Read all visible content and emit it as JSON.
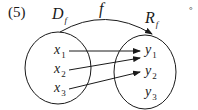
{
  "problem_number": "(5)",
  "domain_label": {
    "main": "D",
    "sub": "f"
  },
  "function_label": "f",
  "range_label": {
    "main": "R",
    "sub": "f"
  },
  "trailing_mark": "°",
  "domain_elements": [
    {
      "main": "x",
      "sub": "1"
    },
    {
      "main": "x",
      "sub": "2"
    },
    {
      "main": "x",
      "sub": "3"
    }
  ],
  "range_elements": [
    {
      "main": "y",
      "sub": "1"
    },
    {
      "main": "y",
      "sub": "2"
    },
    {
      "main": "y",
      "sub": "3"
    }
  ],
  "mappings": [
    {
      "from": "x1",
      "to": "y1"
    },
    {
      "from": "x2",
      "to": "y1"
    },
    {
      "from": "x3",
      "to": "y2"
    }
  ],
  "colors": {
    "ink": "#1a1a1a",
    "background": "#ffffff"
  }
}
